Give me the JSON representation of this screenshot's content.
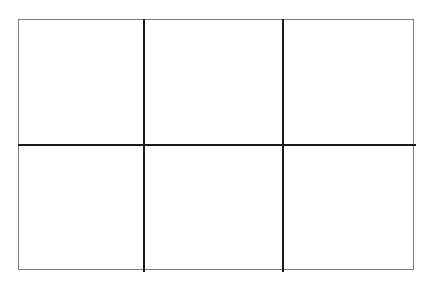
{
  "grid": {
    "rows": 2,
    "columns": 3,
    "cells": [
      {
        "row": 0,
        "col": 0,
        "content": ""
      },
      {
        "row": 0,
        "col": 1,
        "content": ""
      },
      {
        "row": 0,
        "col": 2,
        "content": ""
      },
      {
        "row": 1,
        "col": 0,
        "content": ""
      },
      {
        "row": 1,
        "col": 1,
        "content": ""
      },
      {
        "row": 1,
        "col": 2,
        "content": ""
      }
    ],
    "colors": {
      "outer_border": "#7a7a7a",
      "inner_lines": "#1a1a1a",
      "background": "#ffffff"
    }
  }
}
